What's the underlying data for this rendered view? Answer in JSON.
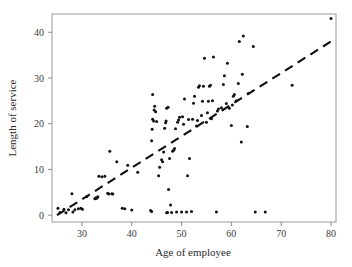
{
  "chart_data": {
    "type": "scatter",
    "title": "",
    "xlabel": "Age of employee",
    "ylabel": "Length of service",
    "xlim": [
      24.0,
      81.0
    ],
    "ylim": [
      -1.5,
      44.0
    ],
    "xticks": [
      30,
      40,
      50,
      60,
      70,
      80
    ],
    "yticks": [
      0,
      10,
      20,
      30,
      40
    ],
    "xtick_labels": [
      "30",
      "40",
      "50",
      "60",
      "70",
      "80"
    ],
    "ytick_labels": [
      "0",
      "10",
      "20",
      "30",
      "40"
    ],
    "grid": false,
    "legend": null,
    "marker": "filled-circle",
    "marker_color": "#111111",
    "points": [
      [
        25.2,
        1.5
      ],
      [
        25.6,
        0.6
      ],
      [
        26.4,
        1.3
      ],
      [
        26.8,
        0.5
      ],
      [
        27.3,
        1.2
      ],
      [
        28.0,
        4.7
      ],
      [
        28.2,
        0.7
      ],
      [
        28.6,
        1.2
      ],
      [
        29.3,
        1.4
      ],
      [
        29.8,
        1.5
      ],
      [
        30.1,
        1.3
      ],
      [
        31.0,
        4.1
      ],
      [
        32.6,
        3.6
      ],
      [
        32.8,
        3.8
      ],
      [
        33.0,
        3.7
      ],
      [
        33.2,
        4.0
      ],
      [
        33.4,
        8.5
      ],
      [
        34.0,
        8.4
      ],
      [
        34.6,
        8.5
      ],
      [
        35.2,
        4.8
      ],
      [
        35.4,
        4.6
      ],
      [
        35.6,
        14.0
      ],
      [
        36.0,
        4.7
      ],
      [
        36.2,
        4.6
      ],
      [
        37.0,
        11.7
      ],
      [
        38.1,
        1.5
      ],
      [
        38.6,
        1.4
      ],
      [
        39.2,
        10.9
      ],
      [
        40.0,
        1.1
      ],
      [
        41.2,
        9.4
      ],
      [
        43.8,
        1.0
      ],
      [
        44.0,
        0.8
      ],
      [
        44.0,
        16.3
      ],
      [
        44.1,
        18.8
      ],
      [
        44.2,
        21.0
      ],
      [
        44.2,
        26.4
      ],
      [
        44.4,
        20.6
      ],
      [
        44.5,
        23.0
      ],
      [
        44.6,
        23.8
      ],
      [
        44.8,
        22.6
      ],
      [
        45.0,
        20.5
      ],
      [
        45.4,
        8.6
      ],
      [
        45.6,
        10.5
      ],
      [
        46.0,
        12.1
      ],
      [
        46.2,
        11.7
      ],
      [
        46.4,
        13.8
      ],
      [
        46.6,
        19.0
      ],
      [
        46.8,
        20.2
      ],
      [
        46.9,
        20.6
      ],
      [
        47.0,
        0.5
      ],
      [
        47.0,
        23.4
      ],
      [
        47.2,
        0.6
      ],
      [
        47.3,
        23.6
      ],
      [
        47.4,
        5.6
      ],
      [
        47.6,
        12.4
      ],
      [
        47.8,
        2.2
      ],
      [
        48.0,
        0.6
      ],
      [
        48.2,
        14.0
      ],
      [
        48.4,
        14.2
      ],
      [
        48.6,
        14.6
      ],
      [
        48.8,
        18.9
      ],
      [
        49.0,
        0.7
      ],
      [
        49.2,
        20.3
      ],
      [
        49.4,
        20.8
      ],
      [
        49.6,
        21.4
      ],
      [
        50.0,
        0.7
      ],
      [
        50.2,
        21.5
      ],
      [
        50.4,
        19.9
      ],
      [
        50.6,
        25.4
      ],
      [
        51.0,
        0.7
      ],
      [
        51.2,
        8.6
      ],
      [
        51.4,
        20.9
      ],
      [
        51.6,
        12.4
      ],
      [
        52.0,
        0.8
      ],
      [
        52.2,
        21.0
      ],
      [
        52.4,
        24.5
      ],
      [
        52.6,
        26.0
      ],
      [
        53.0,
        19.5
      ],
      [
        53.2,
        20.7
      ],
      [
        53.4,
        28.0
      ],
      [
        53.6,
        28.3
      ],
      [
        54.0,
        21.8
      ],
      [
        54.2,
        24.9
      ],
      [
        54.4,
        28.2
      ],
      [
        54.6,
        34.3
      ],
      [
        55.0,
        20.3
      ],
      [
        55.2,
        22.4
      ],
      [
        55.4,
        24.9
      ],
      [
        55.6,
        28.2
      ],
      [
        55.8,
        28.4
      ],
      [
        56.0,
        21.1
      ],
      [
        56.2,
        25.0
      ],
      [
        56.4,
        34.6
      ],
      [
        57.0,
        0.7
      ],
      [
        57.2,
        22.8
      ],
      [
        57.4,
        23.2
      ],
      [
        58.0,
        23.5
      ],
      [
        58.4,
        28.6
      ],
      [
        58.6,
        30.5
      ],
      [
        59.0,
        24.4
      ],
      [
        59.2,
        33.2
      ],
      [
        59.6,
        23.4
      ],
      [
        60.0,
        19.6
      ],
      [
        60.2,
        24.1
      ],
      [
        60.4,
        26.0
      ],
      [
        60.6,
        26.4
      ],
      [
        61.0,
        25.0
      ],
      [
        61.4,
        28.8
      ],
      [
        61.6,
        38.0
      ],
      [
        62.0,
        16.0
      ],
      [
        62.2,
        30.8
      ],
      [
        62.4,
        39.2
      ],
      [
        63.2,
        19.4
      ],
      [
        63.4,
        26.6
      ],
      [
        64.4,
        36.9
      ],
      [
        64.8,
        0.7
      ],
      [
        66.8,
        0.7
      ],
      [
        72.2,
        28.4
      ],
      [
        80.0,
        43.0
      ]
    ],
    "trend_line": {
      "style": "dashed",
      "x_start": 25.0,
      "y_start": 0.0,
      "x_end": 80.0,
      "y_end": 38.0,
      "dash_pattern": "9 6"
    }
  }
}
